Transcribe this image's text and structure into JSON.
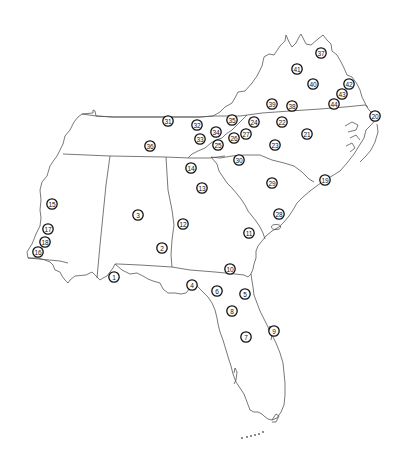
{
  "map": {
    "region": "Southeastern United States",
    "colors": {
      "background": "#ffffff",
      "borders": "#555555",
      "marker_stroke": "#111111",
      "marker_fill": "#ffffff"
    },
    "markers": [
      {
        "id": "1",
        "label": "1",
        "x": 114,
        "y": 277
      },
      {
        "id": "2",
        "label": "2",
        "x": 162,
        "y": 248
      },
      {
        "id": "3",
        "label": "3",
        "x": 138,
        "y": 215
      },
      {
        "id": "4",
        "label": "4",
        "x": 192,
        "y": 285
      },
      {
        "id": "5",
        "label": "5",
        "x": 245,
        "y": 294
      },
      {
        "id": "6",
        "label": "6",
        "x": 217,
        "y": 291
      },
      {
        "id": "7",
        "label": "7",
        "x": 246,
        "y": 337
      },
      {
        "id": "8",
        "label": "8",
        "x": 232,
        "y": 311
      },
      {
        "id": "9",
        "label": "9",
        "x": 274,
        "y": 331
      },
      {
        "id": "10",
        "label": "10",
        "x": 230,
        "y": 269
      },
      {
        "id": "11",
        "label": "11",
        "x": 249,
        "y": 233
      },
      {
        "id": "12",
        "label": "12",
        "x": 183,
        "y": 224
      },
      {
        "id": "13",
        "label": "13",
        "x": 202,
        "y": 188
      },
      {
        "id": "14",
        "label": "14",
        "x": 191,
        "y": 168
      },
      {
        "id": "15",
        "label": "15",
        "x": 52,
        "y": 204
      },
      {
        "id": "16",
        "label": "16",
        "x": 38,
        "y": 252
      },
      {
        "id": "17",
        "label": "17",
        "x": 48,
        "y": 229
      },
      {
        "id": "18",
        "label": "18",
        "x": 45,
        "y": 242
      },
      {
        "id": "19",
        "label": "19",
        "x": 325,
        "y": 180
      },
      {
        "id": "20",
        "label": "20",
        "x": 375,
        "y": 116
      },
      {
        "id": "21",
        "label": "21",
        "x": 307,
        "y": 134
      },
      {
        "id": "22",
        "label": "22",
        "x": 282,
        "y": 122
      },
      {
        "id": "23",
        "label": "23",
        "x": 275,
        "y": 145
      },
      {
        "id": "24",
        "label": "24",
        "x": 254,
        "y": 122
      },
      {
        "id": "25",
        "label": "25",
        "x": 218,
        "y": 145
      },
      {
        "id": "26",
        "label": "26",
        "x": 234,
        "y": 138
      },
      {
        "id": "27",
        "label": "27",
        "x": 246,
        "y": 134
      },
      {
        "id": "28",
        "label": "28",
        "x": 279,
        "y": 214
      },
      {
        "id": "29",
        "label": "29",
        "x": 272,
        "y": 183
      },
      {
        "id": "30",
        "label": "30",
        "x": 239,
        "y": 160
      },
      {
        "id": "31",
        "label": "31",
        "x": 168,
        "y": 121
      },
      {
        "id": "32",
        "label": "32",
        "x": 197,
        "y": 125
      },
      {
        "id": "33",
        "label": "33",
        "x": 200,
        "y": 139
      },
      {
        "id": "34",
        "label": "34",
        "x": 216,
        "y": 132
      },
      {
        "id": "35",
        "label": "35",
        "x": 232,
        "y": 120
      },
      {
        "id": "36",
        "label": "36",
        "x": 150,
        "y": 146
      },
      {
        "id": "37",
        "label": "37",
        "x": 321,
        "y": 53
      },
      {
        "id": "38",
        "label": "38",
        "x": 292,
        "y": 106
      },
      {
        "id": "39",
        "label": "39",
        "x": 272,
        "y": 104
      },
      {
        "id": "40",
        "label": "40",
        "x": 313,
        "y": 84
      },
      {
        "id": "41",
        "label": "41",
        "x": 297,
        "y": 69
      },
      {
        "id": "42",
        "label": "42",
        "x": 349,
        "y": 84
      },
      {
        "id": "43",
        "label": "43",
        "x": 342,
        "y": 94
      },
      {
        "id": "44",
        "label": "44",
        "x": 334,
        "y": 104
      }
    ]
  }
}
